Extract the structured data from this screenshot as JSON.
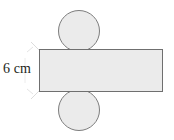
{
  "figure": {
    "name": "cylinder-net-diagram",
    "type": "geometry-net",
    "background_color": "#ffffff",
    "shape_fill": "#ebebeb",
    "shape_stroke": "#7a7a7a",
    "leader_color": "#d8d8d8",
    "text_color": "#231f20"
  },
  "label": {
    "dimension_text": "6 cm",
    "value": 6,
    "unit": "cm",
    "describes": "rectangle-height"
  },
  "parts": {
    "top_circle": {
      "name": "top-circle",
      "cx": 79,
      "cy": 31,
      "r": 20.5
    },
    "bottom_circle": {
      "name": "bottom-circle",
      "cx": 79,
      "cy": 110,
      "r": 20.5
    },
    "rectangle": {
      "name": "lateral-rectangle",
      "x": 39.5,
      "y": 49.5,
      "width": 123,
      "height": 42
    }
  },
  "leader_lines": {
    "top": {
      "x1": 32,
      "y1": 45,
      "x2": 40,
      "y2": 50
    },
    "bottom": {
      "x1": 32,
      "y1": 96,
      "x2": 40,
      "y2": 91
    }
  }
}
